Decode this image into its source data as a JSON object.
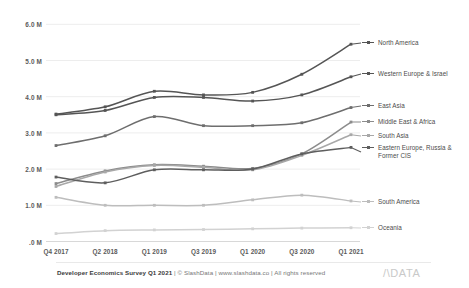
{
  "footer": {
    "survey": "Developer Economics Survey Q1 2021",
    "credits": "| © SlashData | www.slashdata.co | All rights reserved",
    "logo": "/\\DATA"
  },
  "chart_data": {
    "type": "line",
    "title": "",
    "xlabel": "",
    "ylabel": "",
    "grid": true,
    "legend_position": "right",
    "ylim": [
      0,
      6
    ],
    "ytick_labels": [
      ".0 M",
      "1.0 M",
      "2.0 M",
      "3.0 M",
      "4.0 M",
      "5.0 M",
      "6.0 M"
    ],
    "ytick_values": [
      0,
      1,
      2,
      3,
      4,
      5,
      6
    ],
    "categories": [
      "Q4 2017",
      "Q2 2018",
      "Q1 2019",
      "Q3 2019",
      "Q1 2020",
      "Q3 2020",
      "Q1 2021"
    ],
    "series": [
      {
        "name": "North America",
        "color": "#555555",
        "values": [
          3.52,
          3.72,
          4.15,
          4.05,
          4.12,
          4.62,
          5.45
        ]
      },
      {
        "name": "Western Europe & Israel",
        "color": "#555555",
        "values": [
          3.5,
          3.62,
          3.98,
          3.98,
          3.88,
          4.05,
          4.55
        ]
      },
      {
        "name": "East Asia",
        "color": "#6e6e6e",
        "values": [
          2.65,
          2.92,
          3.45,
          3.2,
          3.2,
          3.28,
          3.7
        ]
      },
      {
        "name": "Middle East & Africa",
        "color": "#8c8c8c",
        "values": [
          1.6,
          1.95,
          2.12,
          2.08,
          2.02,
          2.42,
          3.3
        ]
      },
      {
        "name": "South Asia",
        "color": "#a8a8a8",
        "values": [
          1.52,
          1.92,
          2.1,
          2.05,
          1.98,
          2.38,
          2.95
        ]
      },
      {
        "name": "Eastern Europe, Russia & Former CIS",
        "color": "#5e5e5e",
        "values": [
          1.78,
          1.62,
          1.98,
          1.98,
          2.0,
          2.42,
          2.6
        ]
      },
      {
        "name": "South America",
        "color": "#bdbdbd",
        "values": [
          1.22,
          1.0,
          1.0,
          1.0,
          1.15,
          1.28,
          1.12
        ]
      },
      {
        "name": "Oceania",
        "color": "#d2d2d2",
        "values": [
          0.22,
          0.3,
          0.32,
          0.33,
          0.35,
          0.37,
          0.38
        ]
      }
    ],
    "legend_entries": [
      {
        "label": "North America",
        "color": "#555555",
        "y": 43
      },
      {
        "label": "Western Europe & Israel",
        "color": "#555555",
        "y": 74
      },
      {
        "label": "East Asia",
        "color": "#6e6e6e",
        "y": 106
      },
      {
        "label": "Middle East & Africa",
        "color": "#8c8c8c",
        "y": 122
      },
      {
        "label": "South Asia",
        "color": "#a8a8a8",
        "y": 136
      },
      {
        "label": "Eastern Europe, Russia & Former CIS",
        "color": "#5e5e5e",
        "y": 152
      },
      {
        "label": "South America",
        "color": "#bdbdbd",
        "y": 202
      },
      {
        "label": "Oceania",
        "color": "#d2d2d2",
        "y": 228
      }
    ]
  }
}
